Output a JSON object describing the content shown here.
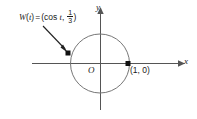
{
  "figure": {
    "background_color": "#ffffff",
    "stroke_color": "#555555",
    "text_color": "#1a1a1a",
    "axes": {
      "x_label": "x",
      "y_label": "y",
      "origin_label": "O",
      "x_range_px": [
        32,
        182
      ],
      "y_range_px": [
        6,
        110
      ],
      "arrow_on_x": true,
      "arrow_on_y": true,
      "grid": false
    },
    "circle": {
      "center_px": [
        100,
        63
      ],
      "radius_px": 29,
      "radius_units": 1,
      "label": "unit circle"
    },
    "points": [
      {
        "name": "w-of-t-point",
        "position_px": [
          68,
          53
        ],
        "label": "",
        "coordinates": "(cos t, 1/3)"
      },
      {
        "name": "one-zero-point",
        "position_px": [
          128,
          63
        ],
        "label": "(1, 0)",
        "coordinates": "(1, 0)"
      }
    ],
    "annotation": {
      "function_name": "W",
      "variable": "t",
      "prefix": "W(t) = (cos t,",
      "fn_letter": "W",
      "open_paren": "(",
      "var_letter": "t",
      "close_paren_1": ")",
      "equals": "=",
      "open_coord": "(cos",
      "cos_var": "t",
      "comma": ",",
      "frac_numerator": "1",
      "frac_denominator": "3",
      "close_coord": ")",
      "arrow_from_px": [
        43,
        26
      ],
      "arrow_to_px": [
        66,
        50
      ]
    }
  }
}
